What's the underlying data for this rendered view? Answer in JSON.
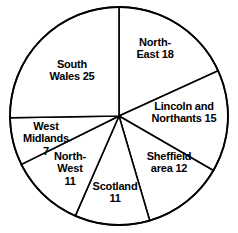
{
  "chart_data": {
    "type": "pie",
    "title": "",
    "subtitle": "",
    "xlabel": "",
    "ylabel": "",
    "legend": "none",
    "grid": false,
    "total": 99,
    "start_angle_deg": 0,
    "direction": "clockwise",
    "center": {
      "x": 119,
      "y": 116
    },
    "radius": 109,
    "categories": [
      "North-East",
      "Lincoln and Northants",
      "Sheffield area",
      "Scotland",
      "North-West",
      "West Midlands",
      "South Wales"
    ],
    "values": [
      18,
      15,
      12,
      11,
      11,
      7,
      25
    ],
    "slices": [
      {
        "name": "North-East",
        "value": 18,
        "label": "North-\nEast 18",
        "label_x": 124,
        "label_y": 36,
        "label_width": 62,
        "start_deg": 0,
        "end_deg": 65.45,
        "fill": "#ffffff",
        "stroke": "#000000"
      },
      {
        "name": "Lincoln and Northants",
        "value": 15,
        "label": "Lincoln and\nNorthants 15",
        "label_x": 143,
        "label_y": 100,
        "label_width": 82,
        "start_deg": 65.45,
        "end_deg": 120.0,
        "fill": "#ffffff",
        "stroke": "#000000"
      },
      {
        "name": "Sheffield area",
        "value": 12,
        "label": "Sheffield\narea 12",
        "label_x": 136,
        "label_y": 150,
        "label_width": 66,
        "start_deg": 120.0,
        "end_deg": 163.64,
        "fill": "#ffffff",
        "stroke": "#000000"
      },
      {
        "name": "Scotland",
        "value": 11,
        "label": "Scotland\n11",
        "label_x": 83,
        "label_y": 180,
        "label_width": 64,
        "start_deg": 163.64,
        "end_deg": 203.64,
        "fill": "#ffffff",
        "stroke": "#000000"
      },
      {
        "name": "North-West",
        "value": 11,
        "label": "North-\nWest\n11",
        "label_x": 46,
        "label_y": 150,
        "label_width": 48,
        "start_deg": 203.64,
        "end_deg": 243.64,
        "fill": "#ffffff",
        "stroke": "#000000"
      },
      {
        "name": "West Midlands",
        "value": 7,
        "label": "West\nMidlands\n7",
        "label_x": 12,
        "label_y": 120,
        "label_width": 68,
        "start_deg": 243.64,
        "end_deg": 269.09,
        "fill": "#ffffff",
        "stroke": "#000000"
      },
      {
        "name": "South Wales",
        "value": 25,
        "label": "South\nWales 25",
        "label_x": 38,
        "label_y": 58,
        "label_width": 68,
        "start_deg": 269.09,
        "end_deg": 360.0,
        "fill": "#ffffff",
        "stroke": "#000000"
      }
    ]
  }
}
